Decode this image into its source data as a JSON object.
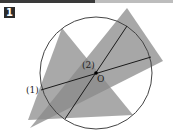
{
  "problem": {
    "number": "1"
  },
  "figure": {
    "circle": {
      "cx": 96,
      "cy": 73,
      "r": 56,
      "stroke": "#444444"
    },
    "triangles": [
      {
        "points": "62,28 133,115 28,120",
        "fill": "#8c8c8c",
        "opacity": 0.75
      },
      {
        "points": "127,8 163,61 30,128",
        "fill": "#8a8a8a",
        "opacity": 0.75
      }
    ],
    "lines": [
      {
        "label": "(1)",
        "x1": 41,
        "y1": 90,
        "x2": 151,
        "y2": 57
      },
      {
        "label": "(2)",
        "x1": 65,
        "y1": 119,
        "x2": 127,
        "y2": 26
      }
    ],
    "center": {
      "label": "O",
      "x": 96,
      "y": 73
    },
    "labels": {
      "line1": "(1)",
      "line2": "(2)",
      "center": "O"
    }
  }
}
